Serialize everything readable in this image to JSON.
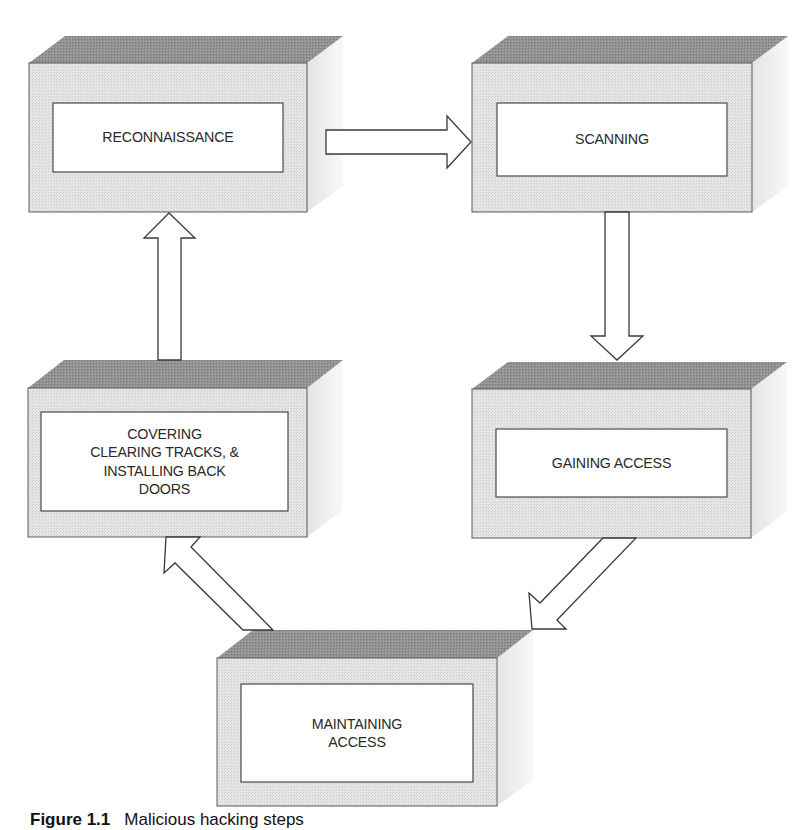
{
  "figure": {
    "caption_label": "Figure 1.1",
    "caption_text": "Malicious hacking steps"
  },
  "colors": {
    "front_face": "#e2e2e2",
    "top_face": "#8f8f8f",
    "side_face": "#ececec",
    "inner_box": "#ffffff",
    "outline": "#4a4a4a",
    "text": "#2a2a2a"
  },
  "steps": [
    {
      "id": "reconnaissance",
      "label": "RECONNAISSANCE"
    },
    {
      "id": "scanning",
      "label": "SCANNING"
    },
    {
      "id": "gaining-access",
      "label": "GAINING ACCESS"
    },
    {
      "id": "maintaining-access",
      "label": "MAINTAINING\nACCESS"
    },
    {
      "id": "covering",
      "label": "COVERING\nCLEARING TRACKS, &\nINSTALLING BACK\nDOORS"
    }
  ],
  "flow": [
    {
      "from": "reconnaissance",
      "to": "scanning",
      "direction": "right"
    },
    {
      "from": "scanning",
      "to": "gaining-access",
      "direction": "down"
    },
    {
      "from": "gaining-access",
      "to": "maintaining-access",
      "direction": "down-left"
    },
    {
      "from": "maintaining-access",
      "to": "covering",
      "direction": "up-left"
    },
    {
      "from": "covering",
      "to": "reconnaissance",
      "direction": "up"
    }
  ]
}
